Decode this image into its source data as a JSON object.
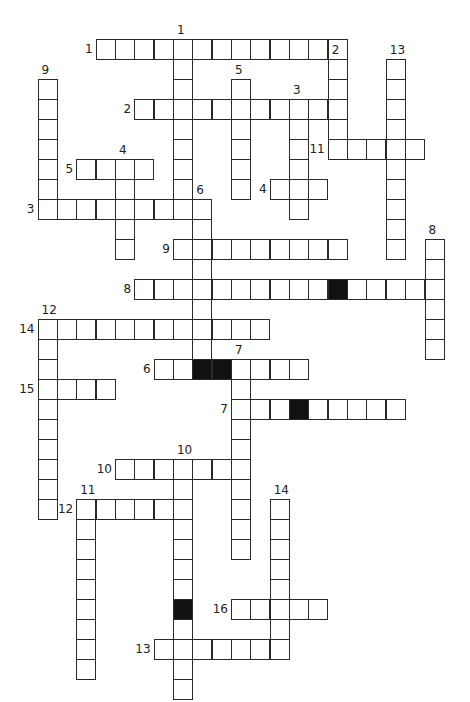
{
  "puzzle": {
    "type": "crossword",
    "grid": {
      "origin_x": 37.5,
      "origin_y": 38.5,
      "pitch_x": 19.35,
      "pitch_y": 20.0,
      "cell_w": 20,
      "cell_h": 21
    },
    "colors": {
      "line": "#2a2a2a",
      "cell": "#ffffff",
      "blocked": "#111111",
      "background": "#ffffff"
    },
    "across": [
      {
        "number": "1",
        "col": 3,
        "row": 0,
        "length": 13,
        "blocked": []
      },
      {
        "number": "2",
        "col": 5,
        "row": 3,
        "length": 11,
        "blocked": []
      },
      {
        "number": "11",
        "col": 15,
        "row": 5,
        "length": 5,
        "blocked": []
      },
      {
        "number": "5",
        "col": 2,
        "row": 6,
        "length": 4,
        "blocked": []
      },
      {
        "number": "4",
        "col": 12,
        "row": 7,
        "length": 3,
        "blocked": []
      },
      {
        "number": "3",
        "col": 0,
        "row": 8,
        "length": 9,
        "blocked": []
      },
      {
        "number": "9",
        "col": 7,
        "row": 10,
        "length": 9,
        "blocked": []
      },
      {
        "number": "8",
        "col": 5,
        "row": 12,
        "length": 16,
        "blocked": [
          10
        ]
      },
      {
        "number": "14",
        "col": 0,
        "row": 14,
        "length": 12,
        "blocked": []
      },
      {
        "number": "6",
        "col": 6,
        "row": 16,
        "length": 8,
        "blocked": [
          3
        ]
      },
      {
        "number": "15",
        "col": 0,
        "row": 17,
        "length": 4,
        "blocked": []
      },
      {
        "number": "7",
        "col": 10,
        "row": 18,
        "length": 9,
        "blocked": [
          3
        ]
      },
      {
        "number": "10",
        "col": 4,
        "row": 21,
        "length": 7,
        "blocked": []
      },
      {
        "number": "12",
        "col": 2,
        "row": 23,
        "length": 6,
        "blocked": []
      },
      {
        "number": "16",
        "col": 10,
        "row": 28,
        "length": 5,
        "blocked": []
      },
      {
        "number": "13",
        "col": 6,
        "row": 30,
        "length": 7,
        "blocked": []
      }
    ],
    "down": [
      {
        "number": "1",
        "col": 7,
        "row": 0,
        "length": 9,
        "blocked": []
      },
      {
        "number": "2",
        "col": 15,
        "row": 1,
        "length": 5,
        "blocked": []
      },
      {
        "number": "13",
        "col": 18,
        "row": 1,
        "length": 10,
        "blocked": []
      },
      {
        "number": "9",
        "col": 0,
        "row": 2,
        "length": 7,
        "blocked": []
      },
      {
        "number": "5",
        "col": 10,
        "row": 2,
        "length": 6,
        "blocked": []
      },
      {
        "number": "3",
        "col": 13,
        "row": 3,
        "length": 6,
        "blocked": []
      },
      {
        "number": "4",
        "col": 4,
        "row": 6,
        "length": 5,
        "blocked": []
      },
      {
        "number": "6",
        "col": 8,
        "row": 8,
        "length": 9,
        "blocked": [
          8
        ]
      },
      {
        "number": "8",
        "col": 20,
        "row": 10,
        "length": 6,
        "blocked": []
      },
      {
        "number": "12",
        "col": 0,
        "row": 14,
        "length": 10,
        "blocked": []
      },
      {
        "number": "7",
        "col": 10,
        "row": 16,
        "length": 10,
        "blocked": []
      },
      {
        "number": "10",
        "col": 7,
        "row": 21,
        "length": 12,
        "blocked": [
          7
        ]
      },
      {
        "number": "11",
        "col": 2,
        "row": 23,
        "length": 9,
        "blocked": []
      },
      {
        "number": "14",
        "col": 12,
        "row": 23,
        "length": 8,
        "blocked": []
      }
    ]
  }
}
